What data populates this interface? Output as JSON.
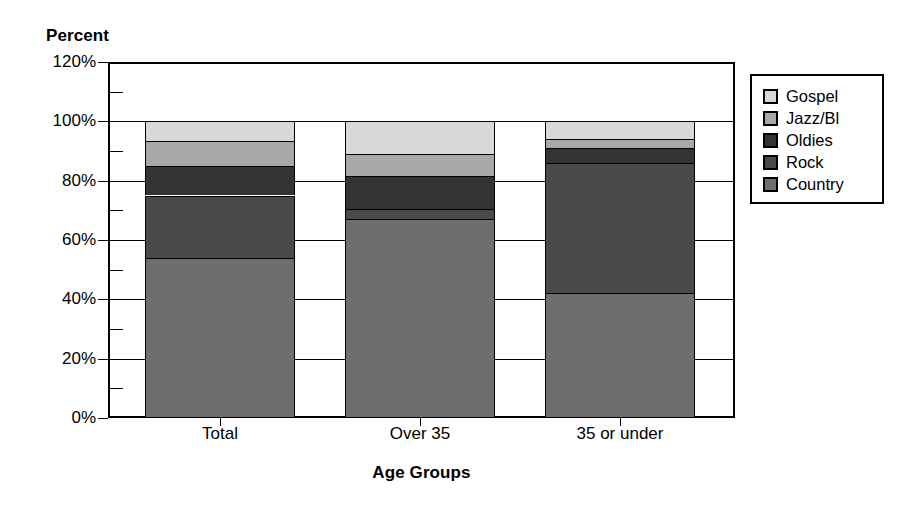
{
  "chart_data": {
    "type": "bar",
    "subtype": "stacked-bar-100",
    "title": "",
    "xlabel": "Age Groups",
    "ylabel": "Percent",
    "ylim": [
      0,
      120
    ],
    "ytick_step": 20,
    "yminor_step": 10,
    "grid": false,
    "legend_position": "right",
    "categories": [
      "Total",
      "Over 35",
      "35 or under"
    ],
    "ytick_labels": [
      "0%",
      "20%",
      "40%",
      "60%",
      "80%",
      "100%",
      "120%"
    ],
    "ytick_values": [
      0,
      20,
      40,
      60,
      80,
      100,
      120
    ],
    "yminor_values": [
      10,
      30,
      50,
      70,
      90,
      110
    ],
    "series": [
      {
        "name": "Country",
        "color": "#6e6e6e",
        "values": [
          54,
          67,
          42
        ]
      },
      {
        "name": "Rock",
        "color": "#4a4a4a",
        "values": [
          21,
          3.5,
          44
        ]
      },
      {
        "name": "Oldies",
        "color": "#333333",
        "values": [
          10,
          11,
          5
        ]
      },
      {
        "name": "Jazz/Bl",
        "color": "#a8a8a8",
        "values": [
          8.5,
          7.5,
          3
        ]
      },
      {
        "name": "Gospel",
        "color": "#d8d8d8",
        "values": [
          6.5,
          11,
          6
        ]
      }
    ],
    "stack_order_bottom_to_top": [
      "Country",
      "Rock",
      "Oldies",
      "Jazz/Bl",
      "Gospel"
    ]
  },
  "axes": {
    "y_title": "Percent",
    "x_title": "Age Groups"
  },
  "legend": {
    "entries": [
      {
        "label": "Gospel",
        "color": "#d8d8d8"
      },
      {
        "label": "Jazz/Bl",
        "color": "#a8a8a8"
      },
      {
        "label": "Oldies",
        "color": "#333333"
      },
      {
        "label": "Rock",
        "color": "#4a4a4a"
      },
      {
        "label": "Country",
        "color": "#6e6e6e"
      }
    ]
  },
  "colors": {
    "background": "#ffffff",
    "foreground": "#000000",
    "gospel": "#d8d8d8",
    "jazz": "#a8a8a8",
    "oldies": "#333333",
    "rock": "#4a4a4a",
    "country": "#6e6e6e"
  }
}
